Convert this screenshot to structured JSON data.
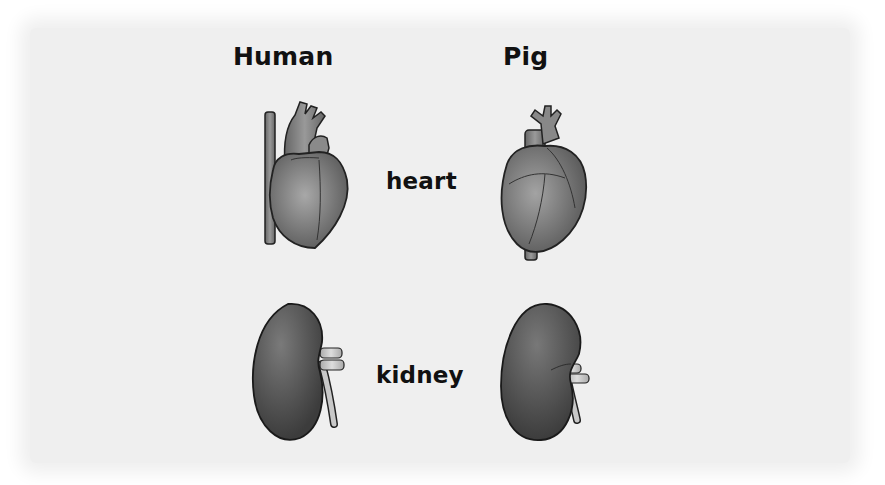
{
  "columns": [
    {
      "title": "Human"
    },
    {
      "title": "Pig"
    }
  ],
  "rows": [
    {
      "label": "heart"
    },
    {
      "label": "kidney"
    }
  ],
  "illustrations": [
    {
      "name": "human-heart",
      "row": "heart",
      "column": "Human"
    },
    {
      "name": "pig-heart",
      "row": "heart",
      "column": "Pig"
    },
    {
      "name": "human-kidney",
      "row": "kidney",
      "column": "Human"
    },
    {
      "name": "pig-kidney",
      "row": "kidney",
      "column": "Pig"
    }
  ],
  "colors": {
    "background": "#efefef",
    "organ_dark": "#4a4a4a",
    "organ_mid": "#8a8a8a",
    "organ_light": "#b5b5b5",
    "text": "#111111"
  }
}
